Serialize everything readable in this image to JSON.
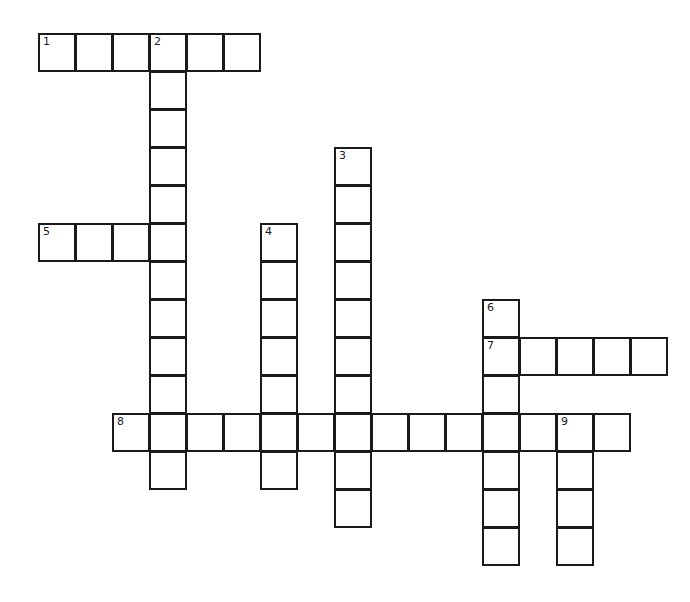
{
  "puzzle": {
    "type": "crossword",
    "cell_width": 37,
    "cell_height": 38,
    "origin_x": 38,
    "origin_y": 33,
    "line_color": "#1a1a1a",
    "entries": [
      {
        "number": "1",
        "direction": "across",
        "row": 0,
        "col": 0,
        "length": 6
      },
      {
        "number": "2",
        "direction": "down",
        "row": 0,
        "col": 3,
        "length": 12
      },
      {
        "number": "3",
        "direction": "down",
        "row": 3,
        "col": 8,
        "length": 10
      },
      {
        "number": "4",
        "direction": "down",
        "row": 5,
        "col": 6,
        "length": 7
      },
      {
        "number": "5",
        "direction": "across",
        "row": 5,
        "col": 0,
        "length": 4
      },
      {
        "number": "6",
        "direction": "down",
        "row": 7,
        "col": 12,
        "length": 7
      },
      {
        "number": "7",
        "direction": "across",
        "row": 8,
        "col": 12,
        "length": 5
      },
      {
        "number": "8",
        "direction": "across",
        "row": 10,
        "col": 2,
        "length": 14
      },
      {
        "number": "9",
        "direction": "down",
        "row": 10,
        "col": 14,
        "length": 4
      }
    ]
  }
}
